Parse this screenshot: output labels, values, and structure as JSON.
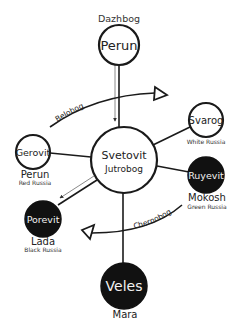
{
  "diagram": {
    "title_label": "Dazhbog",
    "nodes": [
      {
        "id": "perun-top",
        "name": "Perun",
        "cx": 119,
        "cy": 45,
        "r": 20,
        "filled": false,
        "font_size": 13
      },
      {
        "id": "svetovit",
        "name": "Svetovit",
        "subname": "Jutrobog",
        "cx": 124,
        "cy": 160,
        "r": 33,
        "filled": false,
        "font_size": 11
      },
      {
        "id": "svarog",
        "name": "Svarog",
        "cx": 206,
        "cy": 120,
        "r": 17,
        "filled": false,
        "font_size": 10
      },
      {
        "id": "gerovit",
        "name": "Gerovit",
        "cx": 33,
        "cy": 152,
        "r": 17,
        "filled": false,
        "font_size": 9.5
      },
      {
        "id": "ruyevit",
        "name": "Ruyevit",
        "cx": 206,
        "cy": 175,
        "r": 18,
        "filled": true,
        "font_size": 9.5
      },
      {
        "id": "porevit",
        "name": "Porevit",
        "cx": 43,
        "cy": 219,
        "r": 18,
        "filled": true,
        "font_size": 9.5
      },
      {
        "id": "veles",
        "name": "Veles",
        "cx": 124,
        "cy": 286,
        "r": 23,
        "filled": true,
        "font_size": 14
      }
    ],
    "captions": {
      "svarog": {
        "region": "White Russia"
      },
      "gerovit": {
        "deity": "Perun",
        "region": "Red Russia"
      },
      "ruyevit": {
        "deity": "Mokosh",
        "region": "Green Russia"
      },
      "porevit": {
        "deity": "Lada",
        "region": "Black Russia"
      },
      "veles": {
        "deity": "Mara"
      }
    },
    "arcs": [
      {
        "id": "belobog",
        "label": "Belobog",
        "direction": "clockwise"
      },
      {
        "id": "chernobog",
        "label": "Chernobog",
        "direction": "clockwise"
      }
    ],
    "edges": [
      {
        "from": "perun-top",
        "to": "svetovit",
        "arrow": true
      },
      {
        "from": "svetovit",
        "to": "svarog",
        "arrow": false
      },
      {
        "from": "svetovit",
        "to": "gerovit",
        "arrow": false
      },
      {
        "from": "svetovit",
        "to": "ruyevit",
        "arrow": false
      },
      {
        "from": "svetovit",
        "to": "porevit",
        "arrow": true
      },
      {
        "from": "svetovit",
        "to": "veles",
        "arrow": false
      }
    ],
    "colors": {
      "background": "#ffffff",
      "stroke": "#1a1a1a",
      "filled_node": "#111111",
      "thin_arrow_line": "#8a8a8a"
    }
  }
}
